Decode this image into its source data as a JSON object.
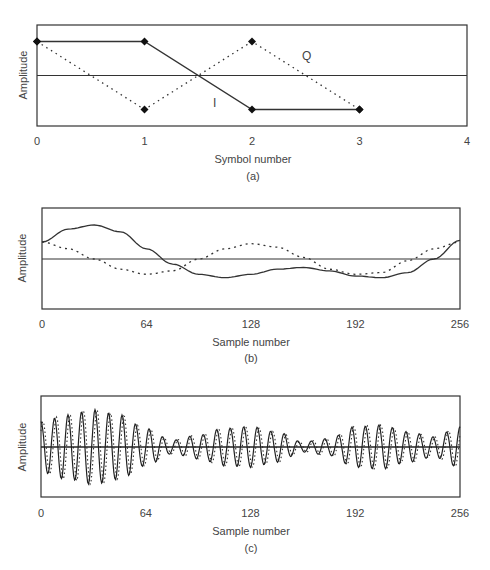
{
  "chart_data": [
    {
      "type": "line",
      "panel_label": "(a)",
      "title": "",
      "xlabel": "Symbol number",
      "ylabel": "Amplitude",
      "x_ticks": [
        "0",
        "1",
        "2",
        "3",
        "4"
      ],
      "xlim": [
        0,
        4
      ],
      "ylim": [
        -1.5,
        1.5
      ],
      "grid": false,
      "zero_line": true,
      "annotations": [
        {
          "text": "Q",
          "x": 2.5,
          "y": 0.55
        },
        {
          "text": "I",
          "x": 1.65,
          "y": -0.85
        }
      ],
      "series": [
        {
          "name": "I",
          "style": "solid",
          "marker": "diamond",
          "x": [
            0,
            1,
            2,
            3
          ],
          "y": [
            1,
            1,
            -1,
            -1
          ]
        },
        {
          "name": "Q",
          "style": "dotted",
          "marker": "diamond",
          "x": [
            0,
            1,
            2,
            3
          ],
          "y": [
            1,
            -1,
            1,
            -1
          ]
        }
      ]
    },
    {
      "type": "line",
      "panel_label": "(b)",
      "title": "",
      "xlabel": "Sample number",
      "ylabel": "Amplitude",
      "x_ticks": [
        "0",
        "64",
        "128",
        "192",
        "256"
      ],
      "xlim": [
        0,
        256
      ],
      "ylim": [
        -1.5,
        1.5
      ],
      "grid": false,
      "zero_line": true,
      "series": [
        {
          "name": "I (filtered)",
          "style": "solid",
          "x": [
            0,
            16,
            32,
            48,
            64,
            80,
            96,
            112,
            128,
            144,
            160,
            176,
            192,
            208,
            224,
            240,
            256
          ],
          "y": [
            0.5,
            0.88,
            1.0,
            0.8,
            0.3,
            -0.15,
            -0.45,
            -0.55,
            -0.45,
            -0.3,
            -0.25,
            -0.35,
            -0.5,
            -0.55,
            -0.4,
            0.0,
            0.55
          ]
        },
        {
          "name": "Q (filtered)",
          "style": "dotted",
          "x": [
            0,
            16,
            32,
            48,
            64,
            80,
            96,
            112,
            128,
            144,
            160,
            176,
            192,
            208,
            224,
            240,
            256
          ],
          "y": [
            0.5,
            0.3,
            0.0,
            -0.3,
            -0.45,
            -0.35,
            0.0,
            0.3,
            0.45,
            0.35,
            0.05,
            -0.3,
            -0.45,
            -0.4,
            -0.05,
            0.3,
            0.5
          ]
        }
      ]
    },
    {
      "type": "line",
      "panel_label": "(c)",
      "title": "",
      "xlabel": "Sample number",
      "ylabel": "Amplitude",
      "x_ticks": [
        "0",
        "64",
        "128",
        "192",
        "256"
      ],
      "xlim": [
        0,
        256
      ],
      "ylim": [
        -1.5,
        1.5
      ],
      "grid": false,
      "zero_line": true,
      "description": "Modulated carrier (~31 cycles over 256 samples) with amplitude envelope",
      "carrier_cycles": 31,
      "envelope": {
        "x": [
          0,
          16,
          32,
          48,
          64,
          80,
          96,
          112,
          128,
          144,
          160,
          176,
          192,
          208,
          224,
          240,
          256
        ],
        "y": [
          0.75,
          0.95,
          1.1,
          0.95,
          0.55,
          0.2,
          0.35,
          0.55,
          0.6,
          0.45,
          0.15,
          0.25,
          0.6,
          0.65,
          0.45,
          0.3,
          0.6
        ]
      },
      "series": [
        {
          "name": "modulated (solid)",
          "style": "solid"
        },
        {
          "name": "modulated (dotted, phase-shifted)",
          "style": "dotted"
        }
      ]
    }
  ]
}
